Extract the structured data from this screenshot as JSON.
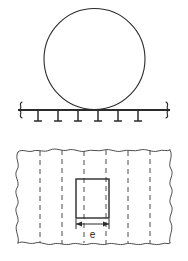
{
  "figure": {
    "background_color": "#ffffff",
    "line_color": "#2b2b2b",
    "dashed_line_color": "#4a4a4a"
  },
  "elevation_view": {
    "name": "elevation-view",
    "circle": {
      "label": "roller-circle",
      "center_x": 94.5,
      "center_y": 59,
      "radius": 50.5
    },
    "support_line": {
      "label": "support-line",
      "x_start": 18,
      "x_end": 170,
      "y": 110
    },
    "break_symbols": [
      {
        "label": "break-symbol-left",
        "x": 20,
        "y": 110
      },
      {
        "label": "break-symbol-right",
        "x": 168,
        "y": 110
      }
    ],
    "hatch_ticks": {
      "label": "support-hatch-ticks",
      "count": 6,
      "x_positions": [
        38,
        58,
        78,
        98,
        118,
        138
      ],
      "y_top": 111,
      "y_bottom": 122,
      "foot_half_width": 4
    }
  },
  "plan_view": {
    "name": "plan-view",
    "broken_region": {
      "label": "broken-out-section",
      "left": 18,
      "right": 170,
      "top": 150,
      "bottom": 245
    },
    "dashed_lines": {
      "label": "hidden-edge-dashed-lines",
      "count": 6,
      "x_positions": [
        40,
        62,
        84,
        106,
        128,
        150
      ]
    },
    "rectangle": {
      "label": "section-rectangle",
      "x": 76,
      "y": 179,
      "width": 33,
      "height": 39
    },
    "dimension": {
      "label": "dimension-e",
      "text": "e",
      "line_y": 224,
      "x_start": 76,
      "x_end": 109,
      "text_x": 92.5,
      "text_y": 235
    }
  }
}
